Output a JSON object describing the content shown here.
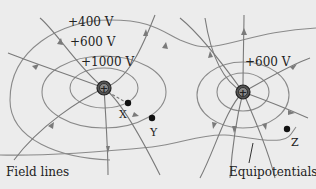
{
  "colors": {
    "background": "#ececec",
    "line": "#7a7a7a",
    "text": "#222222",
    "charge": "#333333",
    "point": "#111111"
  },
  "equipotential_labels": {
    "v400": "+400 V",
    "v600_left": "+600 V",
    "v1000": "+1000 V",
    "v600_right": "+600 V"
  },
  "points": {
    "x": "X",
    "y": "Y",
    "z": "Z"
  },
  "captions": {
    "field_lines": "Field lines",
    "equipotentials": "Equipotentials"
  },
  "charges": [
    {
      "symbol": "+",
      "position": "left"
    },
    {
      "symbol": "+",
      "position": "right"
    }
  ]
}
